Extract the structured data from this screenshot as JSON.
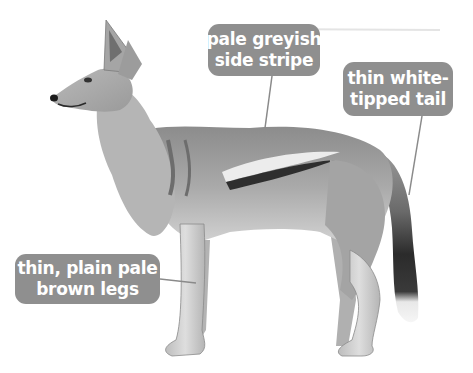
{
  "figure": {
    "background_color": "#ffffff",
    "label_color": "#8f8f8f",
    "label_text_color": "#ffffff",
    "leader_line_color": "#8a8a8a"
  },
  "labels": [
    {
      "id": "stripe",
      "lines": [
        "pale greyish",
        "side stripe"
      ]
    },
    {
      "id": "tail",
      "lines": [
        "thin white-",
        "tipped tail"
      ]
    },
    {
      "id": "legs",
      "lines": [
        "thin, plain pale",
        "brown legs"
      ]
    }
  ]
}
